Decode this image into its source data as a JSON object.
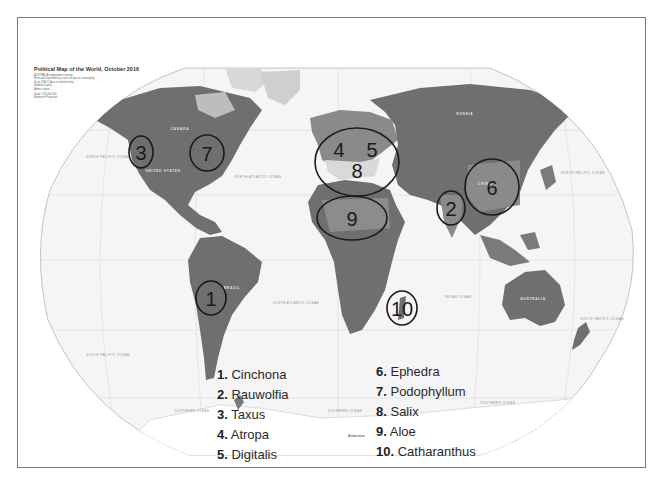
{
  "map": {
    "title": "Political Map of the World, October 2016",
    "key_lines": [
      "AUSTRALIA  Independent country",
      "Bermuda  Dependency or area of special sovereignty",
      "Sicily (ITALY)  Area of related entity",
      "National capital",
      "Admin capital"
    ],
    "scale_note": [
      "Scale 1:35,000,000",
      "Robinson Projection"
    ],
    "ocean_labels": {
      "north_pacific_left": "NORTH PACIFIC OCEAN",
      "north_atlantic": "NORTH ATLANTIC OCEAN",
      "south_atlantic": "SOUTH ATLANTIC OCEAN",
      "indian": "INDIAN OCEAN",
      "north_pacific_right": "NORTH PACIFIC OCEAN",
      "south_pacific_right": "SOUTH PACIFIC OCEAN",
      "south_pacific_left": "SOUTH PACIFIC OCEAN",
      "southern_left": "SOUTHERN OCEAN",
      "southern_mid": "SOUTHERN OCEAN",
      "southern_right": "SOUTHERN OCEAN"
    },
    "country_labels": {
      "canada": "CANADA",
      "united_states": "UNITED STATES",
      "brazil": "BRAZIL",
      "russia": "RUSSIA",
      "china": "CHINA",
      "australia": "AUSTRALIA",
      "antarctica": "Antarctica"
    },
    "colors": {
      "land": "#6f6f6f",
      "land_light": "#bdbdbd",
      "ocean": "#f4f4f4",
      "circle": "#1a1a1a",
      "border": "#7a7a7a"
    }
  },
  "markers": [
    {
      "id": "1",
      "label": "1"
    },
    {
      "id": "2",
      "label": "2"
    },
    {
      "id": "3",
      "label": "3"
    },
    {
      "id": "4",
      "label": "4"
    },
    {
      "id": "5",
      "label": "5"
    },
    {
      "id": "6",
      "label": "6"
    },
    {
      "id": "7",
      "label": "7"
    },
    {
      "id": "8",
      "label": "8"
    },
    {
      "id": "9",
      "label": "9"
    },
    {
      "id": "10",
      "label": "10"
    }
  ],
  "legend": {
    "column1": [
      {
        "num": "1.",
        "name": "Cinchona"
      },
      {
        "num": "2.",
        "name": "Rauwolfia"
      },
      {
        "num": "3.",
        "name": "Taxus"
      },
      {
        "num": "4.",
        "name": "Atropa"
      },
      {
        "num": "5.",
        "name": "Digitalis"
      }
    ],
    "column2": [
      {
        "num": "6.",
        "name": "Ephedra"
      },
      {
        "num": "7.",
        "name": "Podophyllum"
      },
      {
        "num": "8.",
        "name": "Salix"
      },
      {
        "num": "9.",
        "name": "Aloe"
      },
      {
        "num": "10.",
        "name": "Catharanthus"
      }
    ]
  }
}
